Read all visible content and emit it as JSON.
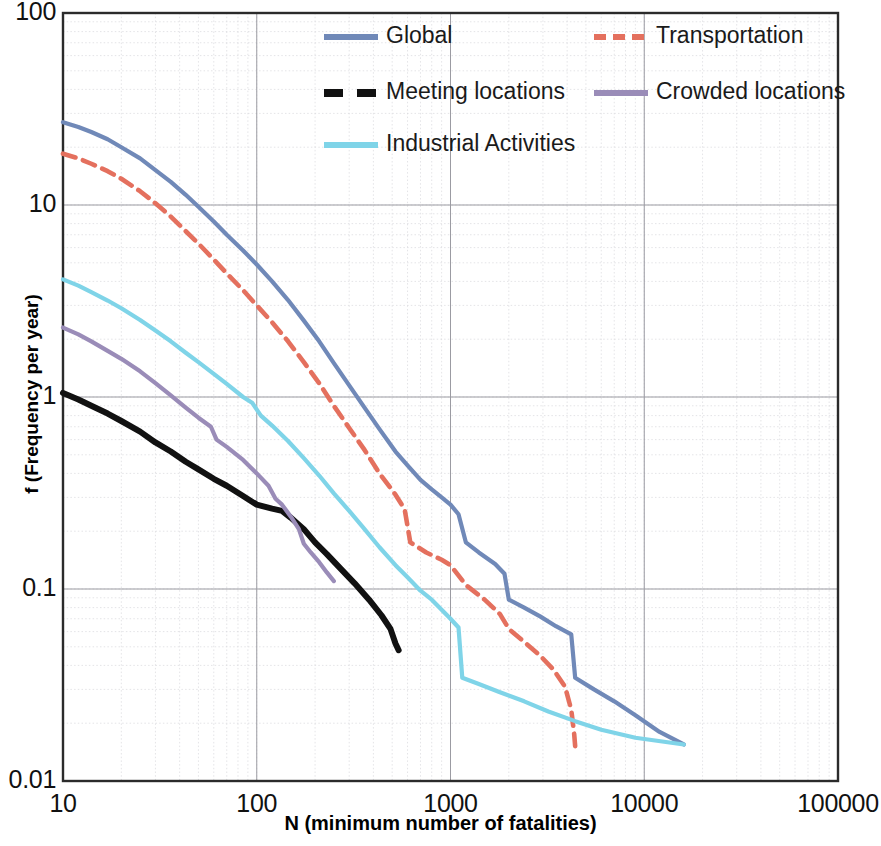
{
  "chart_data": {
    "type": "line",
    "title": "",
    "xlabel": "N (minimum number of fatalities)",
    "ylabel": "f (Frequency per year)",
    "xscale": "log",
    "yscale": "log",
    "xlim": [
      10,
      100000
    ],
    "ylim": [
      0.01,
      100
    ],
    "xticks": [
      "10",
      "100",
      "1000",
      "10000",
      "100000"
    ],
    "yticks": [
      "100",
      "10",
      "1",
      "0.1",
      "0.01"
    ],
    "grid": true,
    "legend_position": "top-right-inside",
    "series": [
      {
        "name": "Global",
        "color": "#7089b8",
        "style": "solid",
        "points": [
          [
            10,
            27.0
          ],
          [
            12,
            25.5
          ],
          [
            14,
            24.0
          ],
          [
            17,
            22.0
          ],
          [
            20,
            20.0
          ],
          [
            25,
            17.5
          ],
          [
            30,
            15.2
          ],
          [
            36,
            13.2
          ],
          [
            43,
            11.3
          ],
          [
            50,
            9.8
          ],
          [
            60,
            8.2
          ],
          [
            70,
            7.0
          ],
          [
            85,
            5.8
          ],
          [
            100,
            4.9
          ],
          [
            120,
            4.0
          ],
          [
            145,
            3.2
          ],
          [
            175,
            2.5
          ],
          [
            210,
            1.95
          ],
          [
            250,
            1.5
          ],
          [
            300,
            1.15
          ],
          [
            360,
            0.88
          ],
          [
            430,
            0.68
          ],
          [
            520,
            0.52
          ],
          [
            600,
            0.44
          ],
          [
            700,
            0.37
          ],
          [
            800,
            0.33
          ],
          [
            900,
            0.3
          ],
          [
            1000,
            0.275
          ],
          [
            1100,
            0.245
          ],
          [
            1200,
            0.175
          ],
          [
            1400,
            0.155
          ],
          [
            1700,
            0.135
          ],
          [
            1900,
            0.12
          ],
          [
            2000,
            0.088
          ],
          [
            2400,
            0.08
          ],
          [
            2900,
            0.072
          ],
          [
            3500,
            0.064
          ],
          [
            4200,
            0.058
          ],
          [
            4400,
            0.0345
          ],
          [
            5500,
            0.03
          ],
          [
            7000,
            0.026
          ],
          [
            9000,
            0.022
          ],
          [
            12000,
            0.018
          ],
          [
            16000,
            0.0155
          ]
        ]
      },
      {
        "name": "Transportation",
        "color": "#e4705e",
        "style": "dashed",
        "points": [
          [
            10,
            18.5
          ],
          [
            12,
            17.5
          ],
          [
            14,
            16.4
          ],
          [
            17,
            15.0
          ],
          [
            20,
            13.7
          ],
          [
            25,
            11.8
          ],
          [
            30,
            10.2
          ],
          [
            36,
            8.7
          ],
          [
            43,
            7.3
          ],
          [
            50,
            6.3
          ],
          [
            60,
            5.2
          ],
          [
            70,
            4.4
          ],
          [
            85,
            3.6
          ],
          [
            100,
            3.0
          ],
          [
            120,
            2.45
          ],
          [
            145,
            1.95
          ],
          [
            175,
            1.52
          ],
          [
            210,
            1.18
          ],
          [
            250,
            0.9
          ],
          [
            300,
            0.69
          ],
          [
            360,
            0.53
          ],
          [
            430,
            0.4
          ],
          [
            520,
            0.31
          ],
          [
            580,
            0.26
          ],
          [
            620,
            0.175
          ],
          [
            750,
            0.155
          ],
          [
            900,
            0.142
          ],
          [
            1000,
            0.133
          ],
          [
            1200,
            0.105
          ],
          [
            1500,
            0.088
          ],
          [
            1800,
            0.074
          ],
          [
            2000,
            0.062
          ],
          [
            2400,
            0.053
          ],
          [
            2900,
            0.045
          ],
          [
            3400,
            0.038
          ],
          [
            3900,
            0.031
          ],
          [
            4200,
            0.0235
          ],
          [
            4350,
            0.0175
          ],
          [
            4400,
            0.0152
          ]
        ]
      },
      {
        "name": "Meeting locations",
        "color": "#111111",
        "style": "solid-thick",
        "points": [
          [
            10,
            1.05
          ],
          [
            12,
            0.97
          ],
          [
            14,
            0.9
          ],
          [
            17,
            0.82
          ],
          [
            20,
            0.75
          ],
          [
            25,
            0.66
          ],
          [
            30,
            0.58
          ],
          [
            36,
            0.52
          ],
          [
            43,
            0.46
          ],
          [
            50,
            0.42
          ],
          [
            60,
            0.375
          ],
          [
            70,
            0.345
          ],
          [
            85,
            0.305
          ],
          [
            100,
            0.275
          ],
          [
            120,
            0.262
          ],
          [
            135,
            0.255
          ],
          [
            150,
            0.235
          ],
          [
            175,
            0.205
          ],
          [
            200,
            0.175
          ],
          [
            230,
            0.152
          ],
          [
            270,
            0.128
          ],
          [
            320,
            0.107
          ],
          [
            380,
            0.088
          ],
          [
            440,
            0.073
          ],
          [
            490,
            0.062
          ],
          [
            520,
            0.052
          ],
          [
            540,
            0.048
          ]
        ]
      },
      {
        "name": "Crowded locations",
        "color": "#9a8cb8",
        "style": "solid",
        "points": [
          [
            10,
            2.3
          ],
          [
            12,
            2.12
          ],
          [
            14,
            1.95
          ],
          [
            17,
            1.74
          ],
          [
            20,
            1.58
          ],
          [
            25,
            1.36
          ],
          [
            30,
            1.18
          ],
          [
            36,
            1.02
          ],
          [
            43,
            0.88
          ],
          [
            50,
            0.78
          ],
          [
            58,
            0.7
          ],
          [
            62,
            0.6
          ],
          [
            70,
            0.55
          ],
          [
            85,
            0.47
          ],
          [
            100,
            0.4
          ],
          [
            115,
            0.345
          ],
          [
            125,
            0.295
          ],
          [
            135,
            0.275
          ],
          [
            150,
            0.238
          ],
          [
            165,
            0.205
          ],
          [
            175,
            0.172
          ],
          [
            190,
            0.155
          ],
          [
            210,
            0.138
          ],
          [
            230,
            0.122
          ],
          [
            250,
            0.11
          ]
        ]
      },
      {
        "name": "Industrial Activities",
        "color": "#7fd4e8",
        "style": "solid",
        "points": [
          [
            10,
            4.1
          ],
          [
            12,
            3.8
          ],
          [
            14,
            3.52
          ],
          [
            17,
            3.18
          ],
          [
            20,
            2.9
          ],
          [
            25,
            2.52
          ],
          [
            30,
            2.22
          ],
          [
            36,
            1.95
          ],
          [
            43,
            1.7
          ],
          [
            50,
            1.52
          ],
          [
            60,
            1.32
          ],
          [
            70,
            1.17
          ],
          [
            85,
            1.0
          ],
          [
            95,
            0.93
          ],
          [
            105,
            0.8
          ],
          [
            120,
            0.71
          ],
          [
            145,
            0.59
          ],
          [
            175,
            0.48
          ],
          [
            210,
            0.39
          ],
          [
            250,
            0.315
          ],
          [
            300,
            0.255
          ],
          [
            360,
            0.205
          ],
          [
            430,
            0.165
          ],
          [
            520,
            0.133
          ],
          [
            600,
            0.115
          ],
          [
            700,
            0.098
          ],
          [
            800,
            0.088
          ],
          [
            900,
            0.078
          ],
          [
            1000,
            0.07
          ],
          [
            1100,
            0.063
          ],
          [
            1150,
            0.0345
          ],
          [
            1400,
            0.032
          ],
          [
            1800,
            0.029
          ],
          [
            2400,
            0.026
          ],
          [
            3200,
            0.023
          ],
          [
            4400,
            0.0205
          ],
          [
            6000,
            0.0185
          ],
          [
            9000,
            0.0168
          ],
          [
            16000,
            0.0155
          ]
        ]
      }
    ]
  },
  "legend": {
    "entries": [
      {
        "label": "Global",
        "color": "#7089b8",
        "style": "solid",
        "col": 0,
        "row": 0
      },
      {
        "label": "Transportation",
        "color": "#e4705e",
        "style": "dashed",
        "col": 1,
        "row": 0
      },
      {
        "label": "Meeting locations",
        "color": "#111111",
        "style": "dashed-thick",
        "col": 0,
        "row": 1
      },
      {
        "label": "Crowded locations",
        "color": "#9a8cb8",
        "style": "solid",
        "col": 1,
        "row": 1
      },
      {
        "label": "Industrial Activities",
        "color": "#7fd4e8",
        "style": "solid",
        "col": 0,
        "row": 2
      }
    ]
  },
  "axes": {
    "x_label": "N (minimum number of fatalities)",
    "y_label": "f (Frequency per year)",
    "x_ticks": [
      "10",
      "100",
      "1000",
      "10000",
      "100000"
    ],
    "y_ticks": [
      "100",
      "10",
      "1",
      "0.1",
      "0.01"
    ]
  }
}
